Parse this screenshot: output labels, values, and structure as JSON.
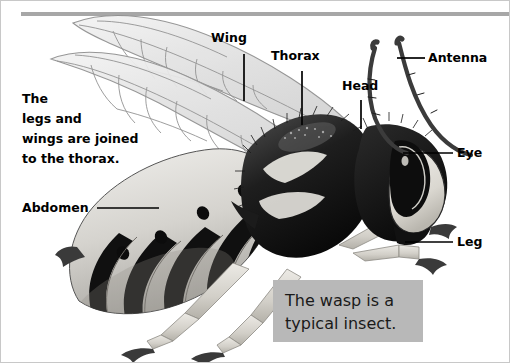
{
  "figure": {
    "background_color": "#ffffff",
    "border_color": "#c8c8c8",
    "rule_color": "#a7a7a7"
  },
  "body_text": {
    "lines": [
      "The",
      "legs and",
      "wings are joined",
      "to the thorax."
    ]
  },
  "labels": {
    "wing": "Wing",
    "thorax": "Thorax",
    "head": "Head",
    "antenna": "Antenna",
    "eye": "Eye",
    "leg": "Leg",
    "abdomen": "Abdomen"
  },
  "caption": {
    "background_color": "#b8b8b8",
    "lines": [
      "The wasp is a",
      "typical insect."
    ]
  },
  "illustration": {
    "subject": "wasp",
    "style": "grayscale scientific illustration",
    "parts": [
      "forewing",
      "hindwing",
      "thorax",
      "head",
      "compound eye",
      "antenna",
      "abdomen",
      "legs"
    ]
  }
}
